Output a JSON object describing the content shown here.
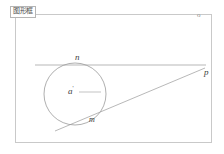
{
  "window": {
    "background_color": "#ffffff",
    "frame_color": "#c9c9c9"
  },
  "title_chip": {
    "label": "图形框"
  },
  "corner": {
    "marker_label": "o"
  },
  "figure": {
    "stroke_color": "#9a9a9a",
    "label_color": "#3c3c3c",
    "circle": {
      "center_label": "a",
      "center_prime": "'",
      "cx": 75,
      "cy": 94,
      "r": 31
    },
    "labels": {
      "n": "n",
      "m": "m",
      "p": "p"
    },
    "tangent_line_horizontal": {
      "x1": 35,
      "y1": 65,
      "x2": 206,
      "y2": 65
    },
    "tangent_line_slanted": {
      "x1": 55,
      "y1": 131,
      "x2": 205,
      "y2": 68
    },
    "radius_line": {
      "x1": 79,
      "y1": 92,
      "x2": 101,
      "y2": 92
    }
  }
}
